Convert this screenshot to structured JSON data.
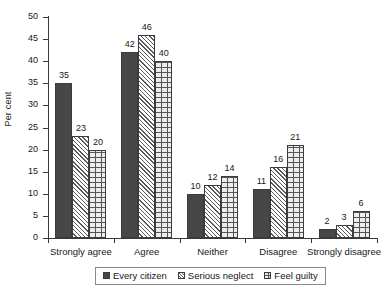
{
  "chart_data": {
    "type": "bar",
    "title": "",
    "subtitle": "",
    "xlabel": "",
    "ylabel": "Per cent",
    "ylim": [
      0,
      50
    ],
    "ytick_step": 5,
    "yticks": [
      0,
      5,
      10,
      15,
      20,
      25,
      30,
      35,
      40,
      45,
      50
    ],
    "grid": false,
    "legend_position": "bottom",
    "categories": [
      "Strongly agree",
      "Agree",
      "Neither",
      "Disagree",
      "Strongly disagree"
    ],
    "series": [
      {
        "name": "Every citizen",
        "pattern": "solid",
        "values": [
          35,
          42,
          10,
          11,
          2
        ]
      },
      {
        "name": "Serious neglect",
        "pattern": "diagonal",
        "values": [
          23,
          46,
          12,
          16,
          3
        ]
      },
      {
        "name": "Feel guilty",
        "pattern": "brick",
        "values": [
          20,
          40,
          14,
          21,
          6
        ]
      }
    ]
  },
  "colors": {
    "series_every_citizen": "#474747",
    "series_serious_neglect": "#ffffff",
    "series_feel_guilty": "#ededed",
    "axis": "#3a3a3a",
    "text": "#171717",
    "background": "#ffffff"
  }
}
